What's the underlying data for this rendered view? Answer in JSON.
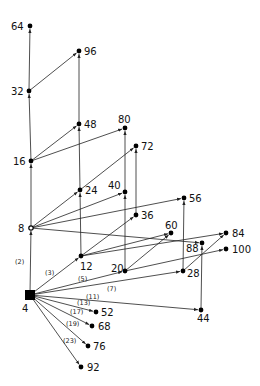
{
  "diagram": {
    "type": "directed-graph",
    "root": "4",
    "nodes": [
      {
        "id": "4",
        "x": 30,
        "y": 295,
        "shape": "square",
        "lx": 22,
        "ly": 312
      },
      {
        "id": "8",
        "x": 31,
        "y": 228,
        "shape": "ring",
        "lx": 18,
        "ly": 232
      },
      {
        "id": "12",
        "x": 81,
        "y": 256,
        "shape": "dot",
        "lx": 80,
        "ly": 270
      },
      {
        "id": "16",
        "x": 31,
        "y": 161,
        "shape": "dot",
        "lx": 13,
        "ly": 165
      },
      {
        "id": "20",
        "x": 125,
        "y": 271,
        "shape": "dot",
        "lx": 111,
        "ly": 272
      },
      {
        "id": "24",
        "x": 80,
        "y": 190,
        "shape": "dot",
        "lx": 85,
        "ly": 194
      },
      {
        "id": "28",
        "x": 183,
        "y": 271,
        "shape": "dot",
        "lx": 187,
        "ly": 277
      },
      {
        "id": "32",
        "x": 29,
        "y": 91,
        "shape": "dot",
        "lx": 11,
        "ly": 95
      },
      {
        "id": "36",
        "x": 136,
        "y": 215,
        "shape": "dot",
        "lx": 141,
        "ly": 219
      },
      {
        "id": "40",
        "x": 125,
        "y": 192,
        "shape": "dot",
        "lx": 108,
        "ly": 189
      },
      {
        "id": "44",
        "x": 201,
        "y": 310,
        "shape": "dot",
        "lx": 197,
        "ly": 322
      },
      {
        "id": "48",
        "x": 79,
        "y": 124,
        "shape": "dot",
        "lx": 84,
        "ly": 128
      },
      {
        "id": "52",
        "x": 96,
        "y": 312,
        "shape": "dot",
        "lx": 101,
        "ly": 316
      },
      {
        "id": "56",
        "x": 184,
        "y": 198,
        "shape": "dot",
        "lx": 189,
        "ly": 202
      },
      {
        "id": "60",
        "x": 171,
        "y": 233,
        "shape": "dot",
        "lx": 165,
        "ly": 229
      },
      {
        "id": "64",
        "x": 30,
        "y": 26,
        "shape": "dot",
        "lx": 11,
        "ly": 30
      },
      {
        "id": "68",
        "x": 92,
        "y": 326,
        "shape": "dot",
        "lx": 98,
        "ly": 330
      },
      {
        "id": "72",
        "x": 136,
        "y": 146,
        "shape": "dot",
        "lx": 141,
        "ly": 150
      },
      {
        "id": "76",
        "x": 88,
        "y": 346,
        "shape": "dot",
        "lx": 93,
        "ly": 350
      },
      {
        "id": "80",
        "x": 125,
        "y": 128,
        "shape": "dot",
        "lx": 118,
        "ly": 123
      },
      {
        "id": "84",
        "x": 226,
        "y": 233,
        "shape": "dot",
        "lx": 232,
        "ly": 237
      },
      {
        "id": "88",
        "x": 202,
        "y": 243,
        "shape": "dot",
        "lx": 186,
        "ly": 252
      },
      {
        "id": "92",
        "x": 81,
        "y": 367,
        "shape": "dot",
        "lx": 87,
        "ly": 371
      },
      {
        "id": "96",
        "x": 79,
        "y": 51,
        "shape": "dot",
        "lx": 84,
        "ly": 55
      },
      {
        "id": "100",
        "x": 226,
        "y": 249,
        "shape": "dot",
        "lx": 232,
        "ly": 253
      }
    ],
    "edges": [
      {
        "from": "4",
        "to": "8",
        "label": "(2)",
        "lx": 15,
        "ly": 264
      },
      {
        "from": "4",
        "to": "12",
        "label": "(3)",
        "lx": 45,
        "ly": 275
      },
      {
        "from": "4",
        "to": "20",
        "label": "(5)",
        "lx": 78,
        "ly": 281
      },
      {
        "from": "4",
        "to": "28",
        "label": "(7)",
        "lx": 107,
        "ly": 291
      },
      {
        "from": "4",
        "to": "44",
        "label": "(11)",
        "lx": 86,
        "ly": 299
      },
      {
        "from": "4",
        "to": "52",
        "label": "(13)",
        "lx": 77,
        "ly": 305
      },
      {
        "from": "4",
        "to": "68",
        "label": "(17)",
        "lx": 70,
        "ly": 314
      },
      {
        "from": "4",
        "to": "76",
        "label": "(19)",
        "lx": 66,
        "ly": 326
      },
      {
        "from": "4",
        "to": "92",
        "label": "(23)",
        "lx": 63,
        "ly": 343
      },
      {
        "from": "8",
        "to": "16",
        "label": ""
      },
      {
        "from": "16",
        "to": "32",
        "label": ""
      },
      {
        "from": "32",
        "to": "64",
        "label": ""
      },
      {
        "from": "32",
        "to": "96",
        "label": ""
      },
      {
        "from": "16",
        "to": "48",
        "label": ""
      },
      {
        "from": "16",
        "to": "80",
        "label": ""
      },
      {
        "from": "8",
        "to": "24",
        "label": ""
      },
      {
        "from": "8",
        "to": "40",
        "label": ""
      },
      {
        "from": "8",
        "to": "56",
        "label": ""
      },
      {
        "from": "8",
        "to": "88",
        "label": ""
      },
      {
        "from": "12",
        "to": "24",
        "label": ""
      },
      {
        "from": "24",
        "to": "48",
        "label": ""
      },
      {
        "from": "48",
        "to": "96",
        "label": ""
      },
      {
        "from": "24",
        "to": "72",
        "label": ""
      },
      {
        "from": "12",
        "to": "36",
        "label": ""
      },
      {
        "from": "12",
        "to": "60",
        "label": ""
      },
      {
        "from": "12",
        "to": "84",
        "label": ""
      },
      {
        "from": "36",
        "to": "72",
        "label": ""
      },
      {
        "from": "20",
        "to": "40",
        "label": ""
      },
      {
        "from": "40",
        "to": "80",
        "label": ""
      },
      {
        "from": "20",
        "to": "60",
        "label": ""
      },
      {
        "from": "20",
        "to": "100",
        "label": ""
      },
      {
        "from": "28",
        "to": "56",
        "label": ""
      },
      {
        "from": "28",
        "to": "84",
        "label": ""
      },
      {
        "from": "44",
        "to": "88",
        "label": ""
      }
    ]
  }
}
